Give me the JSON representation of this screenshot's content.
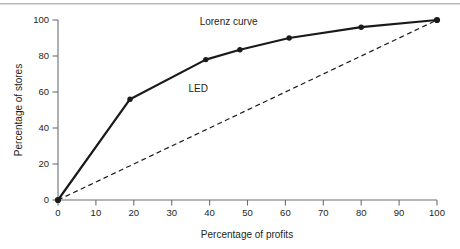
{
  "figure": {
    "background_color": "#ffffff",
    "rule_color": "#b9babc",
    "ink_color": "#231f20"
  },
  "chart_data": {
    "type": "line",
    "title": "",
    "subtitle": "",
    "xlabel": "Percentage of profits",
    "ylabel": "Percentage of stores",
    "xlim": [
      0,
      100
    ],
    "ylim": [
      0,
      100
    ],
    "xticks": [
      0,
      10,
      20,
      30,
      40,
      50,
      60,
      70,
      80,
      90,
      100
    ],
    "xticklabels": [
      "0",
      "10",
      "20",
      "30",
      "40",
      "50",
      "60",
      "70",
      "80",
      "90",
      "100"
    ],
    "yticks": [
      0,
      20,
      40,
      60,
      80,
      100
    ],
    "yticklabels": [
      "0",
      "20",
      "40",
      "60",
      "80",
      "100"
    ],
    "grid": false,
    "legend": "inline-annotations",
    "series": [
      {
        "name": "Lorenz curve",
        "style": "solid",
        "color": "#1a1a1a",
        "linewidth": 2.2,
        "markers": "filled-circle",
        "x": [
          0,
          19,
          39,
          48,
          61,
          80,
          100
        ],
        "y": [
          0,
          56,
          78,
          83.5,
          90,
          96,
          100
        ]
      },
      {
        "name": "LED",
        "style": "dashed",
        "color": "#1a1a1a",
        "linewidth": 1.2,
        "markers": "none",
        "x": [
          0,
          100
        ],
        "y": [
          0,
          100
        ]
      }
    ],
    "annotations": [
      {
        "text": "Lorenz curve",
        "x": 45,
        "y": 97
      },
      {
        "text": "LED",
        "x": 37,
        "y": 60
      }
    ]
  },
  "axes": {
    "x_title": "Percentage of profits",
    "y_title": "Percentage of stores",
    "x_tick_labels": [
      "0",
      "10",
      "20",
      "30",
      "40",
      "50",
      "60",
      "70",
      "80",
      "90",
      "100"
    ],
    "y_tick_labels": [
      "0",
      "20",
      "40",
      "60",
      "80",
      "100"
    ]
  },
  "labels": {
    "lorenz": "Lorenz curve",
    "led": "LED"
  }
}
